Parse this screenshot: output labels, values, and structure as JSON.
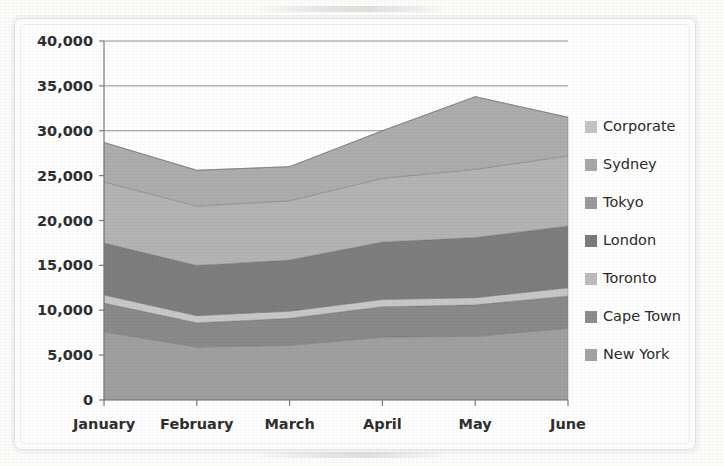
{
  "chart_data": {
    "type": "area",
    "stacked": true,
    "title": "",
    "subtitle": "",
    "xlabel": "",
    "ylabel": "",
    "categories": [
      "January",
      "February",
      "March",
      "April",
      "May",
      "June"
    ],
    "ylim": [
      0,
      40000
    ],
    "ytick_values": [
      0,
      5000,
      10000,
      15000,
      20000,
      25000,
      30000,
      35000,
      40000
    ],
    "ytick_labels": [
      "0",
      "5,000",
      "10,000",
      "15,000",
      "20,000",
      "25,000",
      "30,000",
      "35,000",
      "40,000"
    ],
    "grid": true,
    "grid_axis": "y",
    "legend_position": "right",
    "stack_order_bottom_to_top": [
      "New York",
      "Cape Town",
      "Toronto",
      "London",
      "Tokyo",
      "Sydney",
      "Corporate"
    ],
    "series": [
      {
        "name": "New York",
        "color": "#a0a0a0",
        "values": [
          7600,
          5900,
          6100,
          7000,
          7100,
          8000
        ]
      },
      {
        "name": "Cape Town",
        "color": "#8a8a8a",
        "values": [
          3200,
          2700,
          3000,
          3400,
          3500,
          3600
        ]
      },
      {
        "name": "Toronto",
        "color": "#c8c8c8",
        "values": [
          900,
          800,
          800,
          800,
          800,
          900
        ]
      },
      {
        "name": "London",
        "color": "#7e7e7e",
        "values": [
          5800,
          5600,
          5700,
          6400,
          6700,
          6900
        ]
      },
      {
        "name": "Tokyo",
        "color": "#b4b4b4",
        "values": [
          6800,
          6600,
          6600,
          7100,
          7600,
          7800
        ]
      },
      {
        "name": "Sydney",
        "color": "#adadad",
        "values": [
          4400,
          4000,
          3800,
          5300,
          8100,
          4300
        ]
      },
      {
        "name": "Corporate",
        "color": "#c0c0c0",
        "values": [
          0,
          0,
          0,
          0,
          0,
          0
        ]
      }
    ],
    "cumulative_tops": {
      "New York": [
        7600,
        5900,
        6100,
        7000,
        7100,
        8000
      ],
      "Cape Town": [
        10800,
        8600,
        9100,
        10400,
        10600,
        11600
      ],
      "Toronto": [
        11700,
        9400,
        9900,
        11200,
        11400,
        12500
      ],
      "London": [
        17500,
        15000,
        15600,
        17600,
        18100,
        19400
      ],
      "Tokyo": [
        24300,
        21600,
        22200,
        24700,
        25700,
        27200
      ],
      "Sydney": [
        28700,
        25600,
        26000,
        30000,
        33800,
        31500
      ],
      "Corporate": [
        28700,
        25600,
        26000,
        30000,
        33800,
        31500
      ]
    },
    "legend_entries": [
      {
        "label": "Corporate",
        "swatch": "#c5c5c5"
      },
      {
        "label": "Sydney",
        "swatch": "#a8a8a8"
      },
      {
        "label": "Tokyo",
        "swatch": "#9a9a9a"
      },
      {
        "label": "London",
        "swatch": "#7c7c7c"
      },
      {
        "label": "Toronto",
        "swatch": "#bdbdbd"
      },
      {
        "label": "Cape Town",
        "swatch": "#8d8d8d"
      },
      {
        "label": "New York",
        "swatch": "#a4a4a4"
      }
    ]
  },
  "appearance": {
    "background": "#ffffff",
    "grid_color": "#8f8f8f",
    "axis_color": "#7d7d7d",
    "text_color": "#2f2f2f"
  }
}
